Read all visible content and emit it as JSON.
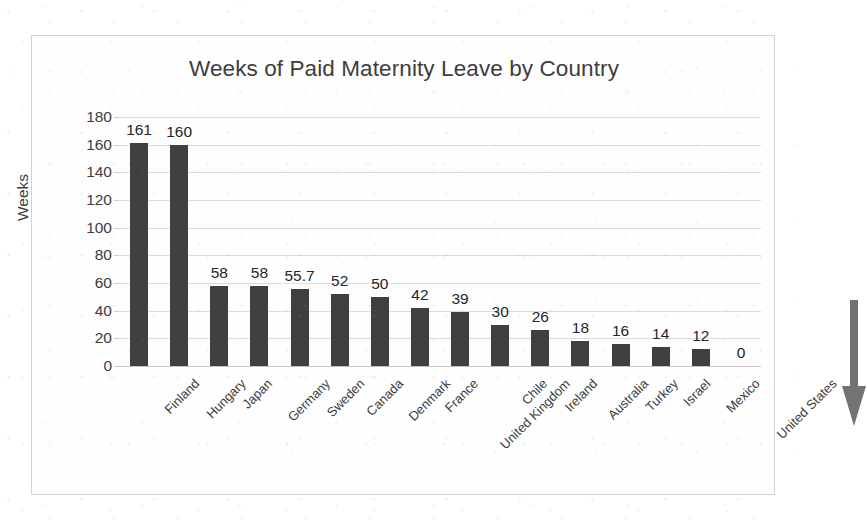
{
  "chart_data": {
    "type": "bar",
    "title": "Weeks of Paid Maternity Leave by Country",
    "xlabel": "",
    "ylabel": "Weeks",
    "ylim": [
      0,
      180
    ],
    "ytick_step": 20,
    "grid": true,
    "legend": false,
    "orientation": "vertical",
    "bar_color": "#404040",
    "categories": [
      "Finland",
      "Hungary",
      "Japan",
      "Germany",
      "Sweden",
      "Canada",
      "Denmark",
      "France",
      "United Kingdom",
      "Chile",
      "Ireland",
      "Australia",
      "Turkey",
      "Israel",
      "Mexico",
      "United States"
    ],
    "values": [
      161,
      160,
      58,
      58,
      55.7,
      52,
      50,
      42,
      39,
      30,
      26,
      18,
      16,
      14,
      12,
      0
    ],
    "value_labels": [
      "161",
      "160",
      "58",
      "58",
      "55.7",
      "52",
      "50",
      "42",
      "39",
      "30",
      "26",
      "18",
      "16",
      "14",
      "12",
      "0"
    ],
    "ytick_labels": [
      "180",
      "160",
      "140",
      "120",
      "100",
      "80",
      "60",
      "40",
      "20",
      "0"
    ],
    "annotations": [
      {
        "name": "down-arrow",
        "shape": "arrow-down",
        "color": "#737373",
        "points_at": "United States",
        "description": "Large grey downward arrow highlighting the United States value of 0"
      }
    ]
  }
}
